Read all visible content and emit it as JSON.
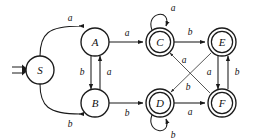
{
  "diagram": {
    "kind": "finite-state-automaton",
    "canvas": {
      "width": 256,
      "height": 140,
      "background": "#ffffff"
    },
    "stroke_color": "#1a1a1a",
    "label_color": "#101010"
  },
  "states": [
    {
      "id": "S",
      "label": "S",
      "cx": 40,
      "cy": 70,
      "r": 14,
      "accepting": false,
      "start": true
    },
    {
      "id": "A",
      "label": "A",
      "cx": 95,
      "cy": 42,
      "r": 14,
      "accepting": false,
      "start": false
    },
    {
      "id": "B",
      "label": "B",
      "cx": 95,
      "cy": 103,
      "r": 14,
      "accepting": false,
      "start": false
    },
    {
      "id": "C",
      "label": "C",
      "cx": 160,
      "cy": 42,
      "r": 14,
      "accepting": true,
      "start": false
    },
    {
      "id": "D",
      "label": "D",
      "cx": 160,
      "cy": 103,
      "r": 14,
      "accepting": true,
      "start": false
    },
    {
      "id": "E",
      "label": "E",
      "cx": 222,
      "cy": 42,
      "r": 14,
      "accepting": true,
      "start": false
    },
    {
      "id": "F",
      "label": "F",
      "cx": 222,
      "cy": 103,
      "r": 14,
      "accepting": true,
      "start": false
    }
  ],
  "alphabet": [
    "a",
    "b"
  ],
  "start_state": "S",
  "accepting_states": [
    "C",
    "D",
    "E",
    "F"
  ],
  "transitions": [
    {
      "id": "S-A",
      "from": "S",
      "to": "A",
      "symbol": "a",
      "shape": "curve-up",
      "label_x": 70,
      "label_y": 28
    },
    {
      "id": "S-B",
      "from": "S",
      "to": "B",
      "symbol": "b",
      "shape": "curve-down",
      "label_x": 70,
      "label_y": 117
    },
    {
      "id": "A-B",
      "from": "A",
      "to": "B",
      "symbol": "b",
      "shape": "vertical",
      "label_x": 83,
      "label_y": 72
    },
    {
      "id": "B-A",
      "from": "B",
      "to": "A",
      "symbol": "a",
      "shape": "vertical",
      "label_x": 108,
      "label_y": 72
    },
    {
      "id": "A-C",
      "from": "A",
      "to": "C",
      "symbol": "a",
      "shape": "horizontal",
      "label_x": 127,
      "label_y": 34
    },
    {
      "id": "B-D",
      "from": "B",
      "to": "D",
      "symbol": "b",
      "shape": "horizontal",
      "label_x": 127,
      "label_y": 112
    },
    {
      "id": "C-C",
      "from": "C",
      "to": "C",
      "symbol": "a",
      "shape": "self-loop-top",
      "label_x": 172,
      "label_y": 8
    },
    {
      "id": "D-D",
      "from": "D",
      "to": "D",
      "symbol": "b",
      "shape": "self-loop-bottom",
      "label_x": 172,
      "label_y": 133
    },
    {
      "id": "C-E",
      "from": "C",
      "to": "E",
      "symbol": "b",
      "shape": "horizontal",
      "label_x": 191,
      "label_y": 33
    },
    {
      "id": "D-F",
      "from": "D",
      "to": "F",
      "symbol": "a",
      "shape": "horizontal",
      "label_x": 191,
      "label_y": 111
    },
    {
      "id": "F-C",
      "from": "F",
      "to": "C",
      "symbol": "a",
      "shape": "diagonal-up",
      "label_x": 183,
      "label_y": 60
    },
    {
      "id": "E-D",
      "from": "E",
      "to": "D",
      "symbol": "b",
      "shape": "diagonal-down",
      "label_x": 186,
      "label_y": 88
    },
    {
      "id": "E-F",
      "from": "E",
      "to": "F",
      "symbol": "a",
      "shape": "vertical",
      "label_x": 211,
      "label_y": 72
    },
    {
      "id": "F-E",
      "from": "F",
      "to": "E",
      "symbol": "b",
      "shape": "vertical",
      "label_x": 235,
      "label_y": 72
    }
  ]
}
